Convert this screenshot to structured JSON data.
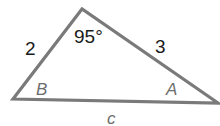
{
  "diagram": {
    "type": "triangle",
    "side_labels": {
      "left_side": "2",
      "right_side": "3",
      "bottom_side": "c"
    },
    "angle_labels": {
      "top_angle": "95°",
      "left_angle": "B",
      "right_angle": "A"
    },
    "colors": {
      "stroke": "#7a7a7a",
      "numeric_text": "#1a1a1a",
      "variable_text": "#6e6e6e"
    }
  }
}
